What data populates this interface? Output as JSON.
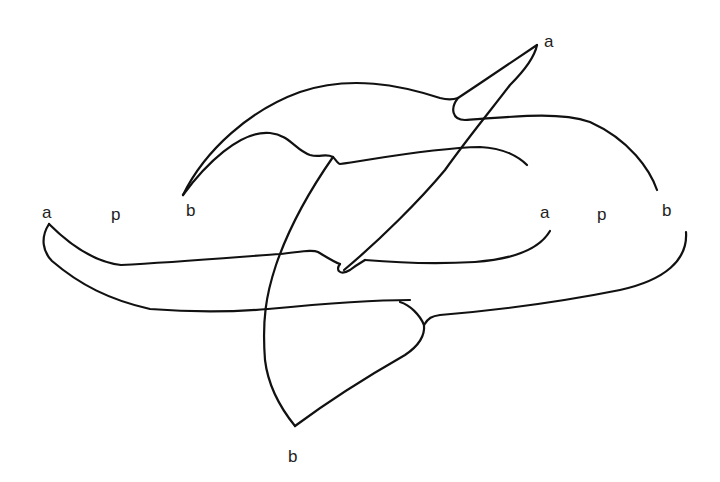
{
  "figure": {
    "type": "knot/link diagram (line drawing)",
    "stroke_color": "#111111",
    "background": "#ffffff"
  },
  "labels": {
    "top_a": "a",
    "left_a": "a",
    "left_p": "p",
    "left_b": "b",
    "right_a": "a",
    "right_p": "p",
    "right_b": "b",
    "bottom_b": "b"
  }
}
